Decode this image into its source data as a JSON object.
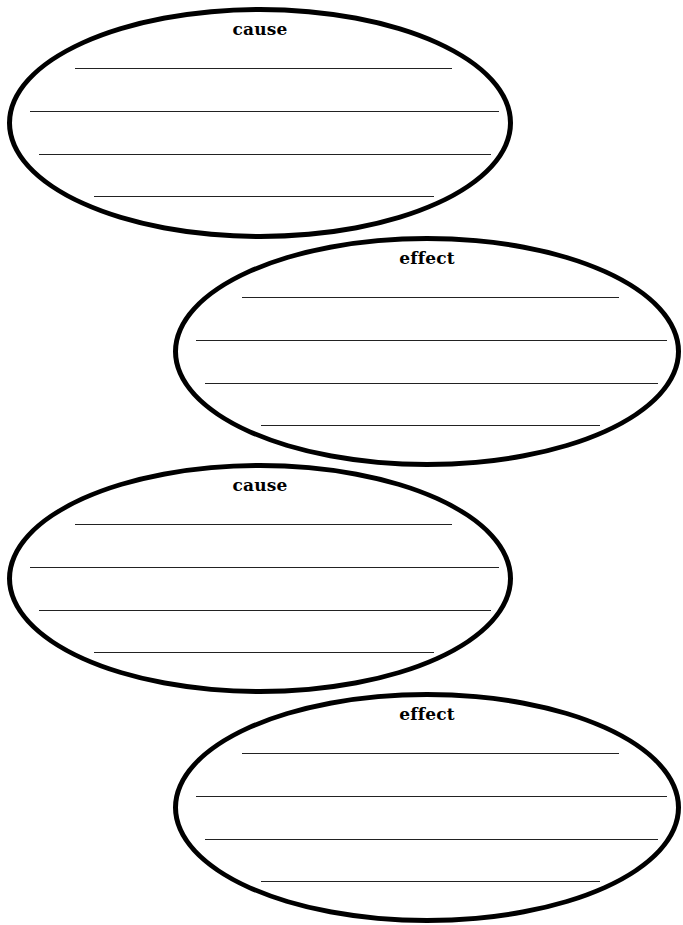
{
  "worksheet": {
    "ovals": [
      {
        "label": "cause",
        "box": {
          "left": 7,
          "top": 7,
          "width": 506,
          "height": 232
        },
        "label_top": 7,
        "lines": [
          {
            "left": 63,
            "top": 56,
            "width": 377
          },
          {
            "left": 18,
            "top": 99,
            "width": 469
          },
          {
            "left": 27,
            "top": 142,
            "width": 452
          },
          {
            "left": 82,
            "top": 184,
            "width": 340
          }
        ]
      },
      {
        "label": "effect",
        "box": {
          "left": 173,
          "top": 236,
          "width": 508,
          "height": 231
        },
        "label_top": 7,
        "lines": [
          {
            "left": 64,
            "top": 56,
            "width": 377
          },
          {
            "left": 18,
            "top": 99,
            "width": 471
          },
          {
            "left": 27,
            "top": 142,
            "width": 453
          },
          {
            "left": 83,
            "top": 184,
            "width": 339
          }
        ]
      },
      {
        "label": "cause",
        "box": {
          "left": 7,
          "top": 463,
          "width": 506,
          "height": 231
        },
        "label_top": 7,
        "lines": [
          {
            "left": 63,
            "top": 56,
            "width": 377
          },
          {
            "left": 18,
            "top": 99,
            "width": 469
          },
          {
            "left": 27,
            "top": 142,
            "width": 452
          },
          {
            "left": 82,
            "top": 184,
            "width": 340
          }
        ]
      },
      {
        "label": "effect",
        "box": {
          "left": 173,
          "top": 692,
          "width": 508,
          "height": 231
        },
        "label_top": 7,
        "lines": [
          {
            "left": 64,
            "top": 56,
            "width": 377
          },
          {
            "left": 18,
            "top": 99,
            "width": 471
          },
          {
            "left": 27,
            "top": 142,
            "width": 453
          },
          {
            "left": 83,
            "top": 184,
            "width": 339
          }
        ]
      }
    ],
    "colors": {
      "outline": "#000000",
      "lines": "#222222",
      "background": "#ffffff"
    }
  }
}
